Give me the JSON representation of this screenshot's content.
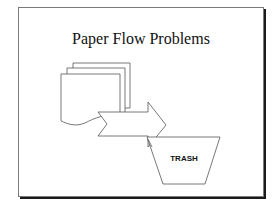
{
  "slide": {
    "title": "Paper Flow Problems",
    "shapes": [
      {
        "name": "paper-stack",
        "description": "three stacked document sheets with wavy bottom"
      },
      {
        "name": "arrow",
        "description": "notched right-pointing block arrow"
      },
      {
        "name": "trash-bin",
        "description": "inverted trapezoid labeled TRASH"
      }
    ],
    "trash_label": "TRASH"
  },
  "colors": {
    "stroke": "#555555",
    "fill": "#ffffff",
    "frame_shadow": "#1a1a1a"
  }
}
